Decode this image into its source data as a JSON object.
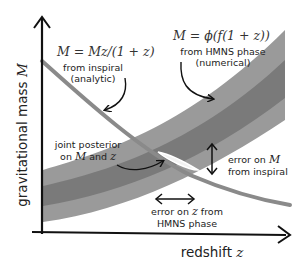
{
  "colors": {
    "band_outer": "#9a9a9a",
    "band_inner": "#7a7a7a",
    "inspiral_line": "#8a8a8a",
    "axis": "#111111",
    "posterior": "#ffffff",
    "text": "#222222"
  },
  "axes": {
    "y_label_text": "gravitational mass",
    "y_label_symbol": "M",
    "x_label_text": "redshift",
    "x_label_symbol": "z"
  },
  "inspiral": {
    "equation": "M = M_z/(1 + z)",
    "equation_display": "M = Mz/(1 + z)",
    "line1": "from inspiral",
    "line2": "(analytic)"
  },
  "hmns": {
    "equation_display": "M = ϕ(f(1 + z))",
    "line1": "from HMNS phase",
    "line2": "(numerical)"
  },
  "posterior": {
    "line1": "joint posterior",
    "line2_prefix": "on ",
    "line2_symbol1": "M",
    "line2_mid": " and ",
    "line2_symbol2": "z"
  },
  "error_M": {
    "line1_prefix": "error on ",
    "line1_symbol": "M",
    "line2": "from inspiral"
  },
  "error_z": {
    "line1_prefix": "error on ",
    "line1_symbol": "z",
    "line1_suffix": " from",
    "line2": "HMNS phase"
  }
}
